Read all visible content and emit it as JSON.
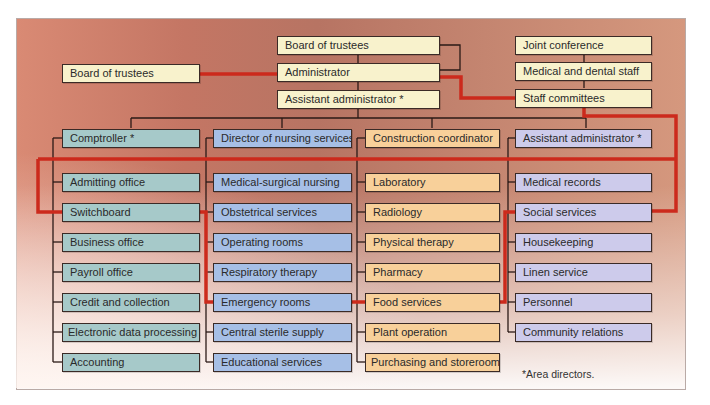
{
  "diagram": {
    "type": "organizational-chart",
    "colors": {
      "executive": "#f8f2cc",
      "comptroller_dept": "#a6c9c9",
      "nursing_dept": "#a6bfe6",
      "construction_dept": "#f8d09a",
      "assistant_admin_dept": "#cdcbeb",
      "communication_line": "#cc2a1c",
      "reporting_line": "#2a1a16"
    },
    "executive": {
      "board_of_trustees": "Board of trustees",
      "administrator": "Administrator",
      "assistant_administrator": "Assistant administrator *"
    },
    "external_board": "Board of trustees",
    "medical_staff": {
      "joint_conference": "Joint conference",
      "medical_dental_staff": "Medical and dental staff",
      "staff_committees": "Staff committees"
    },
    "departments": [
      {
        "head": "Comptroller *",
        "units": [
          "Admitting office",
          "Switchboard",
          "Business office",
          "Payroll office",
          "Credit and collection",
          "Electronic data processing",
          "Accounting"
        ]
      },
      {
        "head": "Director of nursing services",
        "units": [
          "Medical-surgical nursing",
          "Obstetrical services",
          "Operating rooms",
          "Respiratory therapy",
          "Emergency rooms",
          "Central sterile supply",
          "Educational services"
        ]
      },
      {
        "head": "Construction coordinator",
        "units": [
          "Laboratory",
          "Radiology",
          "Physical therapy",
          "Pharmacy",
          "Food services",
          "Plant operation",
          "Purchasing and storeroom"
        ]
      },
      {
        "head": "Assistant administrator *",
        "units": [
          "Medical records",
          "Social services",
          "Housekeeping",
          "Linen service",
          "Personnel",
          "Community relations"
        ]
      }
    ],
    "footnote": "*Area directors."
  }
}
